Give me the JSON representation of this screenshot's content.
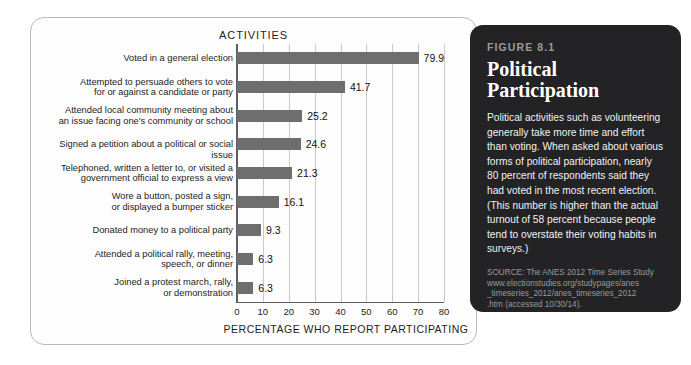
{
  "chart_card": {
    "title": "ACTIVITIES",
    "x_axis_title": "PERCENTAGE WHO REPORT PARTICIPATING"
  },
  "caption": {
    "figure_number": "FIGURE 8.1",
    "title": "Political\nParticipation",
    "body": "Political activities such as volunteering generally take more time and effort than voting. When asked about various forms of political participation, nearly 80 percent of respondents said they had voted in the most recent election. (This number is higher than the actual turnout of 58 percent because people tend to overstate their voting habits in surveys.)",
    "source": "SOURCE: The ANES 2012 Time Series Study www.electionstudies.org/studypages/anes\n_timeseries_2012/anes_timeseries_2012\n.htm (accessed 10/30/14)."
  },
  "colors": {
    "bar": "#6e6e6e",
    "panel_background": "#232325",
    "card_background": "#fdfdfd",
    "gridline": "#c9c9cc",
    "axis": "#5e5e62"
  },
  "chart_data": {
    "type": "bar",
    "orientation": "horizontal",
    "title": "ACTIVITIES",
    "xlabel": "PERCENTAGE WHO REPORT PARTICIPATING",
    "ylabel": "",
    "xlim": [
      0,
      80
    ],
    "xticks": [
      0,
      10,
      20,
      30,
      40,
      50,
      60,
      70,
      80
    ],
    "grid": "vertical",
    "legend": "none",
    "categories": [
      "Voted in a general election",
      "Attempted to persuade others to vote\nfor or against a candidate or party",
      "Attended local community meeting about\nan issue facing one's community or school",
      "Signed a petition about a political or social issue",
      "Telephoned, written a letter to, or visited a\ngovernment official to express a view",
      "Wore a button, posted a sign,\nor displayed a bumper sticker",
      "Donated money to a political party",
      "Attended a political rally, meeting,\nspeech, or dinner",
      "Joined a protest march, rally,\nor demonstration"
    ],
    "values": [
      79.9,
      41.7,
      25.2,
      24.6,
      21.3,
      16.1,
      9.3,
      6.3,
      6.3
    ],
    "value_labels": [
      "79.9",
      "41.7",
      "25.2",
      "24.6",
      "21.3",
      "16.1",
      "9.3",
      "6.3",
      "6.3"
    ]
  }
}
